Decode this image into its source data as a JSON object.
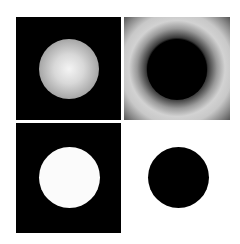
{
  "figure": {
    "layout": "2x2 grid",
    "panels": [
      {
        "position": "top-left",
        "description": "grey shaded sphere on black background",
        "background": "#000000",
        "foreground": "#d8d8d8"
      },
      {
        "position": "top-right",
        "description": "black disc with radial grey halo ring",
        "background": "#9a9a9a",
        "foreground": "#000000"
      },
      {
        "position": "bottom-left",
        "description": "white disc on black background",
        "background": "#000000",
        "foreground": "#fbfbfb"
      },
      {
        "position": "bottom-right",
        "description": "black disc on white background",
        "background": "#ffffff",
        "foreground": "#000000"
      }
    ]
  }
}
